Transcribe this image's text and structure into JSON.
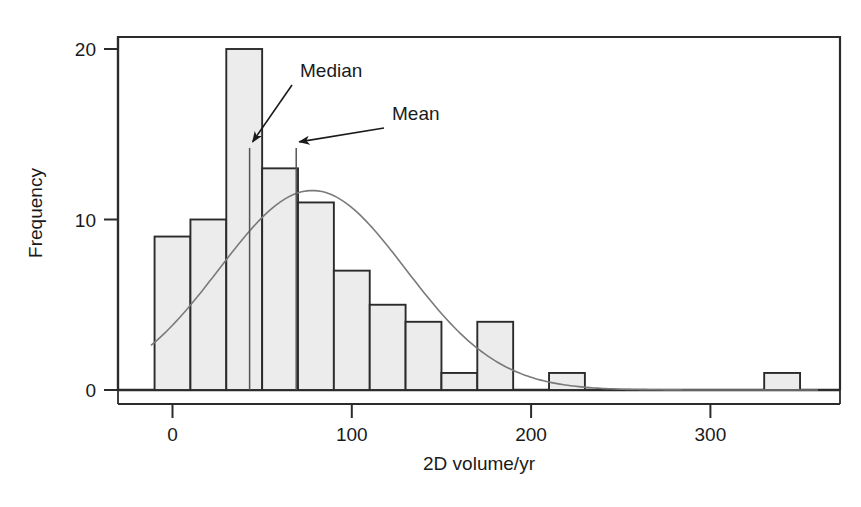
{
  "chart_data": {
    "type": "bar",
    "title": "",
    "subtitle": "",
    "xlabel": "2D volume/yr",
    "ylabel": "Frequency",
    "xlim": [
      -12,
      360
    ],
    "ylim": [
      0,
      20.8
    ],
    "xticks": [
      0,
      100,
      200,
      300
    ],
    "xticklabels": [
      "0",
      "100",
      "200",
      "300"
    ],
    "yticks": [
      0,
      10,
      20
    ],
    "yticklabels": [
      "0",
      "10",
      "20"
    ],
    "grid": false,
    "legend": null,
    "bin_width": 20,
    "bin_edges": [
      -10,
      10,
      30,
      50,
      70,
      90,
      110,
      130,
      150,
      170,
      190,
      210,
      230,
      250,
      270,
      290,
      310,
      330,
      350
    ],
    "categories": [
      "-10-10",
      "10-30",
      "30-50",
      "50-70",
      "70-90",
      "90-110",
      "110-130",
      "130-150",
      "150-170",
      "170-190",
      "190-210",
      "210-230",
      "230-250",
      "250-270",
      "270-290",
      "290-310",
      "310-330",
      "330-350"
    ],
    "values": [
      9,
      10,
      20,
      13,
      11,
      7,
      5,
      4,
      1,
      4,
      0,
      1,
      0,
      0,
      0,
      0,
      0,
      1
    ],
    "bar_fill": "#ececec",
    "bar_edge": "#2b2b2b",
    "overlay_curve": {
      "name": "normal-fit",
      "type": "line",
      "color": "#6b6b6b",
      "mean": 78,
      "sigma": 52,
      "peak_value": 11.7
    },
    "annotations": [
      {
        "label": "Median",
        "value": 43,
        "marker_top_frequency": 14.2,
        "label_x": 300,
        "label_y": 77
      },
      {
        "label": "Mean",
        "value": 69,
        "marker_top_frequency": 14.2,
        "label_x": 392,
        "label_y": 120
      }
    ]
  },
  "figure": {
    "axis_color": "#2b2b2b",
    "background": "#ffffff"
  }
}
